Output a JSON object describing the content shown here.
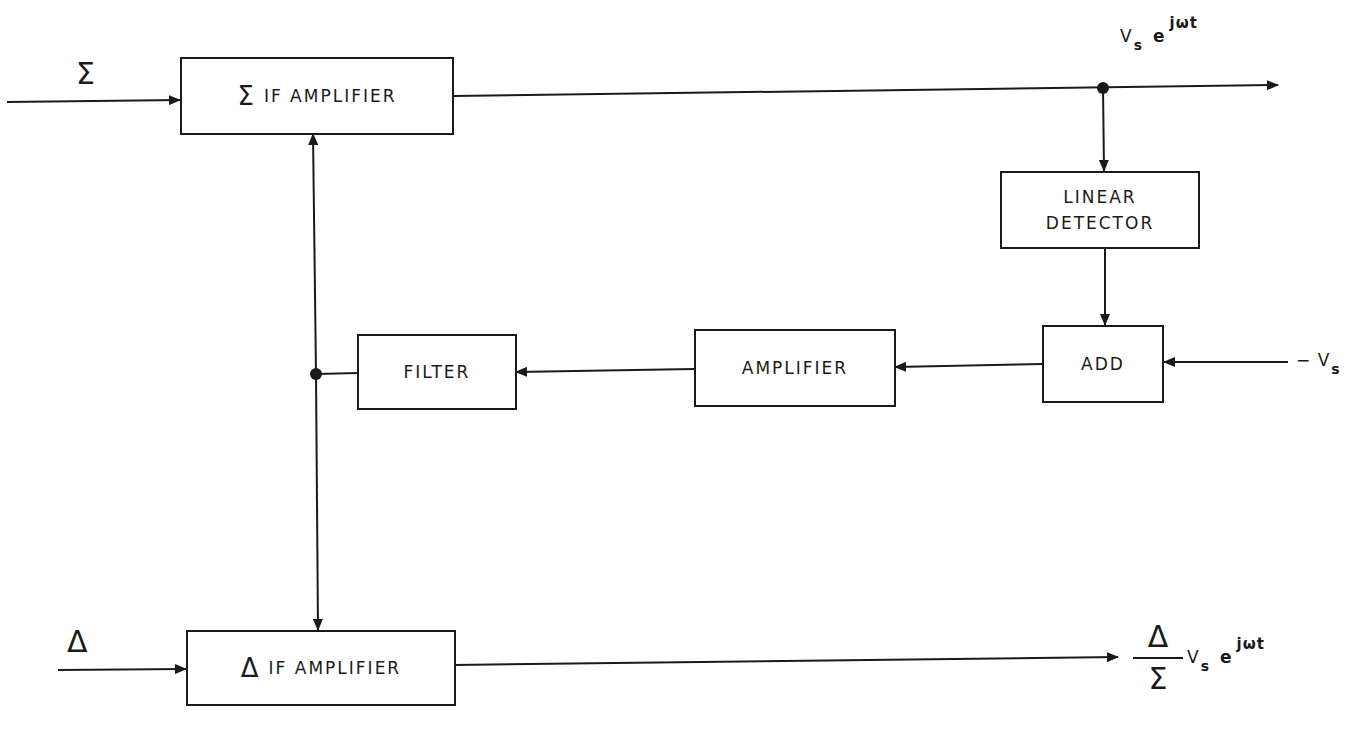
{
  "diagram": {
    "type": "block-diagram",
    "blocks": {
      "sum_if_amp": {
        "symbol": "Σ",
        "label": "IF AMPLIFIER"
      },
      "delta_if_amp": {
        "symbol": "Δ",
        "label": "IF AMPLIFIER"
      },
      "linear_detector": {
        "line1": "LINEAR",
        "line2": "DETECTOR"
      },
      "add": {
        "label": "ADD"
      },
      "amplifier": {
        "label": "AMPLIFIER"
      },
      "filter": {
        "label": "FILTER"
      }
    },
    "inputs": {
      "sum": "Σ",
      "delta": "Δ",
      "neg_vs": {
        "prefix": "− V",
        "sub": "s"
      }
    },
    "outputs": {
      "sum_out": {
        "base": "V",
        "sub": "s",
        "e": "e",
        "sup": "jωt"
      },
      "delta_out": {
        "num": "Δ",
        "den": "Σ",
        "base": "V",
        "sub": "s",
        "e": "e",
        "sup": "jωt"
      }
    },
    "connections": [
      {
        "from": "Σ input",
        "to": "Σ IF AMPLIFIER"
      },
      {
        "from": "Σ IF AMPLIFIER",
        "to": "output V_s e^{jωt}"
      },
      {
        "from": "junction (Σ output)",
        "to": "LINEAR DETECTOR"
      },
      {
        "from": "LINEAR DETECTOR",
        "to": "ADD"
      },
      {
        "from": "−V_s",
        "to": "ADD"
      },
      {
        "from": "ADD",
        "to": "AMPLIFIER"
      },
      {
        "from": "AMPLIFIER",
        "to": "FILTER"
      },
      {
        "from": "FILTER",
        "to": "junction (gain control)"
      },
      {
        "from": "junction (gain control)",
        "to": "Σ IF AMPLIFIER"
      },
      {
        "from": "junction (gain control)",
        "to": "Δ IF AMPLIFIER"
      },
      {
        "from": "Δ input",
        "to": "Δ IF AMPLIFIER"
      },
      {
        "from": "Δ IF AMPLIFIER",
        "to": "output (Δ/Σ) V_s e^{jωt}"
      }
    ]
  }
}
